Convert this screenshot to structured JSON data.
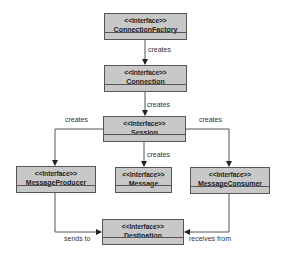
{
  "boxes": {
    "connection_factory": {
      "stereotype": "<<Interface>>",
      "name": "ConnectionFactory"
    },
    "connection": {
      "stereotype": "<<Interface>>",
      "name": "Connection"
    },
    "session": {
      "stereotype": "<<Interface>>",
      "name": "Session"
    },
    "message_producer": {
      "stereotype": "<<Interface>>",
      "name": "MessageProducer"
    },
    "message": {
      "stereotype": "<<Interface>>",
      "name": "Message"
    },
    "message_consumer": {
      "stereotype": "<<Interface>>",
      "name": "MessageConsumer"
    },
    "destination": {
      "stereotype": "<<Interface>>",
      "name": "Destination"
    }
  },
  "edges": {
    "cf_to_connection": "creates",
    "connection_to_session": "creates",
    "session_to_producer": "creates",
    "session_to_message": "creates",
    "session_to_consumer": "creates",
    "producer_to_destination": "sends to",
    "consumer_to_destination": "receives from"
  },
  "colors": {
    "box_fill": "#c8c8c8",
    "line": "#555555"
  }
}
